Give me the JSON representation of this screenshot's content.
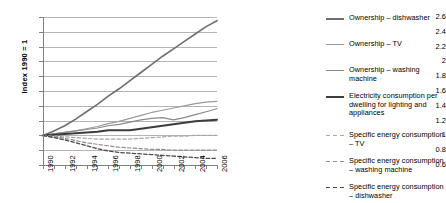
{
  "chart_data": {
    "type": "line",
    "title": "",
    "xlabel": "",
    "ylabel": "Index 1990 = 1",
    "xlim": [
      1990,
      2006
    ],
    "ylim": [
      0.6,
      2.6
    ],
    "ytick_step": 0.2,
    "grid": true,
    "legend_position": "right",
    "x": [
      1990,
      1991,
      1992,
      1993,
      1994,
      1995,
      1996,
      1997,
      1998,
      1999,
      2000,
      2001,
      2002,
      2003,
      2004,
      2005,
      2006
    ],
    "ytick_labels": [
      "2.6",
      "2.4",
      "2.2",
      "2",
      "1.8",
      "1.6",
      "1.4",
      "1.2",
      "1",
      "0.8",
      "0.6"
    ],
    "ytick_values": [
      2.6,
      2.4,
      2.2,
      2.0,
      1.8,
      1.6,
      1.4,
      1.2,
      1.0,
      0.8,
      0.6
    ],
    "xtick_labels": [
      "1990",
      "1992",
      "1994",
      "1996",
      "1998",
      "2000",
      "2002",
      "2004",
      "2006"
    ],
    "xtick_values": [
      1990,
      1992,
      1994,
      1996,
      1998,
      2000,
      2002,
      2004,
      2006
    ],
    "series": [
      {
        "name": "Ownership – dishwasher",
        "color": "#6e6e6e",
        "style": "solid",
        "width": 1.6,
        "values": [
          1.0,
          1.06,
          1.13,
          1.22,
          1.32,
          1.42,
          1.53,
          1.63,
          1.74,
          1.85,
          1.96,
          2.07,
          2.17,
          2.27,
          2.37,
          2.47,
          2.55
        ]
      },
      {
        "name": "Ownership – TV",
        "color": "#9a9a9a",
        "style": "solid",
        "width": 1.2,
        "values": [
          1.0,
          1.02,
          1.04,
          1.06,
          1.09,
          1.12,
          1.16,
          1.19,
          1.23,
          1.27,
          1.31,
          1.34,
          1.37,
          1.4,
          1.43,
          1.45,
          1.46
        ]
      },
      {
        "name": "Ownership – washing machine",
        "color": "#8a8a8a",
        "style": "solid",
        "width": 1.2,
        "values": [
          1.0,
          1.02,
          1.04,
          1.06,
          1.08,
          1.1,
          1.13,
          1.15,
          1.18,
          1.21,
          1.23,
          1.24,
          1.21,
          1.24,
          1.28,
          1.32,
          1.36
        ]
      },
      {
        "name": "Electricity consumption per dwelling for lighting and appliances",
        "color": "#3c3c3c",
        "style": "solid",
        "width": 2.0,
        "values": [
          1.0,
          1.01,
          1.02,
          1.03,
          1.04,
          1.05,
          1.07,
          1.07,
          1.07,
          1.09,
          1.11,
          1.13,
          1.15,
          1.17,
          1.19,
          1.2,
          1.21
        ]
      },
      {
        "name": "Specific energy consumption – TV",
        "color": "#a8a8a8",
        "style": "dashed",
        "width": 1.2,
        "values": [
          1.0,
          0.99,
          0.98,
          0.97,
          0.96,
          0.95,
          0.95,
          0.95,
          0.95,
          0.96,
          0.97,
          0.98,
          0.99,
          0.99,
          1.0,
          1.0,
          1.0
        ]
      },
      {
        "name": "Specific energy consumption – washing machine",
        "color": "#8e8e8e",
        "style": "dashed",
        "width": 1.2,
        "values": [
          1.0,
          0.98,
          0.96,
          0.93,
          0.9,
          0.88,
          0.86,
          0.84,
          0.83,
          0.82,
          0.81,
          0.81,
          0.8,
          0.8,
          0.8,
          0.8,
          0.8
        ]
      },
      {
        "name": "Specific energy consumption – dishwasher",
        "color": "#4a4a4a",
        "style": "dashed",
        "width": 1.3,
        "values": [
          1.0,
          0.97,
          0.94,
          0.9,
          0.86,
          0.82,
          0.79,
          0.77,
          0.76,
          0.75,
          0.74,
          0.73,
          0.72,
          0.71,
          0.7,
          0.69,
          0.69
        ]
      }
    ]
  },
  "legend": {
    "items": [
      {
        "label": "Ownership – dishwasher"
      },
      {
        "label": "Ownership – TV"
      },
      {
        "label": "Ownership – washing machine"
      },
      {
        "label": "Electricity consumption per dwelling for lighting and appliances"
      },
      {
        "label": "Specific energy consumption – TV"
      },
      {
        "label": "Specific energy consumption – washing machine"
      },
      {
        "label": "Specific energy consumption – dishwasher"
      }
    ]
  }
}
